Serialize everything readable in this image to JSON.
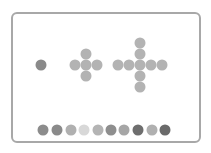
{
  "board": {
    "border_color": "#a8a8a8"
  },
  "puzzle": {
    "single_dot": {
      "x": 41,
      "y": 65,
      "color": "#8a8a8a"
    },
    "small_cross": {
      "color": "#b3b3b3",
      "dots": [
        {
          "x": 86,
          "y": 54
        },
        {
          "x": 75,
          "y": 65
        },
        {
          "x": 86,
          "y": 65
        },
        {
          "x": 97,
          "y": 65
        },
        {
          "x": 86,
          "y": 76
        }
      ]
    },
    "large_cross": {
      "color": "#b3b3b3",
      "dots": [
        {
          "x": 140,
          "y": 43
        },
        {
          "x": 140,
          "y": 54
        },
        {
          "x": 118,
          "y": 65
        },
        {
          "x": 129,
          "y": 65
        },
        {
          "x": 140,
          "y": 65
        },
        {
          "x": 151,
          "y": 65
        },
        {
          "x": 162,
          "y": 65
        },
        {
          "x": 140,
          "y": 76
        },
        {
          "x": 140,
          "y": 87
        }
      ]
    }
  },
  "palette": {
    "y": 130,
    "options": [
      {
        "x": 43,
        "color": "#8c8c8c"
      },
      {
        "x": 57,
        "color": "#8a8a8a"
      },
      {
        "x": 71,
        "color": "#b0b0b0"
      },
      {
        "x": 84,
        "color": "#d8d8d8"
      },
      {
        "x": 98,
        "color": "#b4b4b4"
      },
      {
        "x": 111,
        "color": "#8e8e8e"
      },
      {
        "x": 124,
        "color": "#a6a6a6"
      },
      {
        "x": 138,
        "color": "#6e6e6e"
      },
      {
        "x": 152,
        "color": "#b0b0b0"
      },
      {
        "x": 165,
        "color": "#6a6a6a"
      }
    ]
  }
}
